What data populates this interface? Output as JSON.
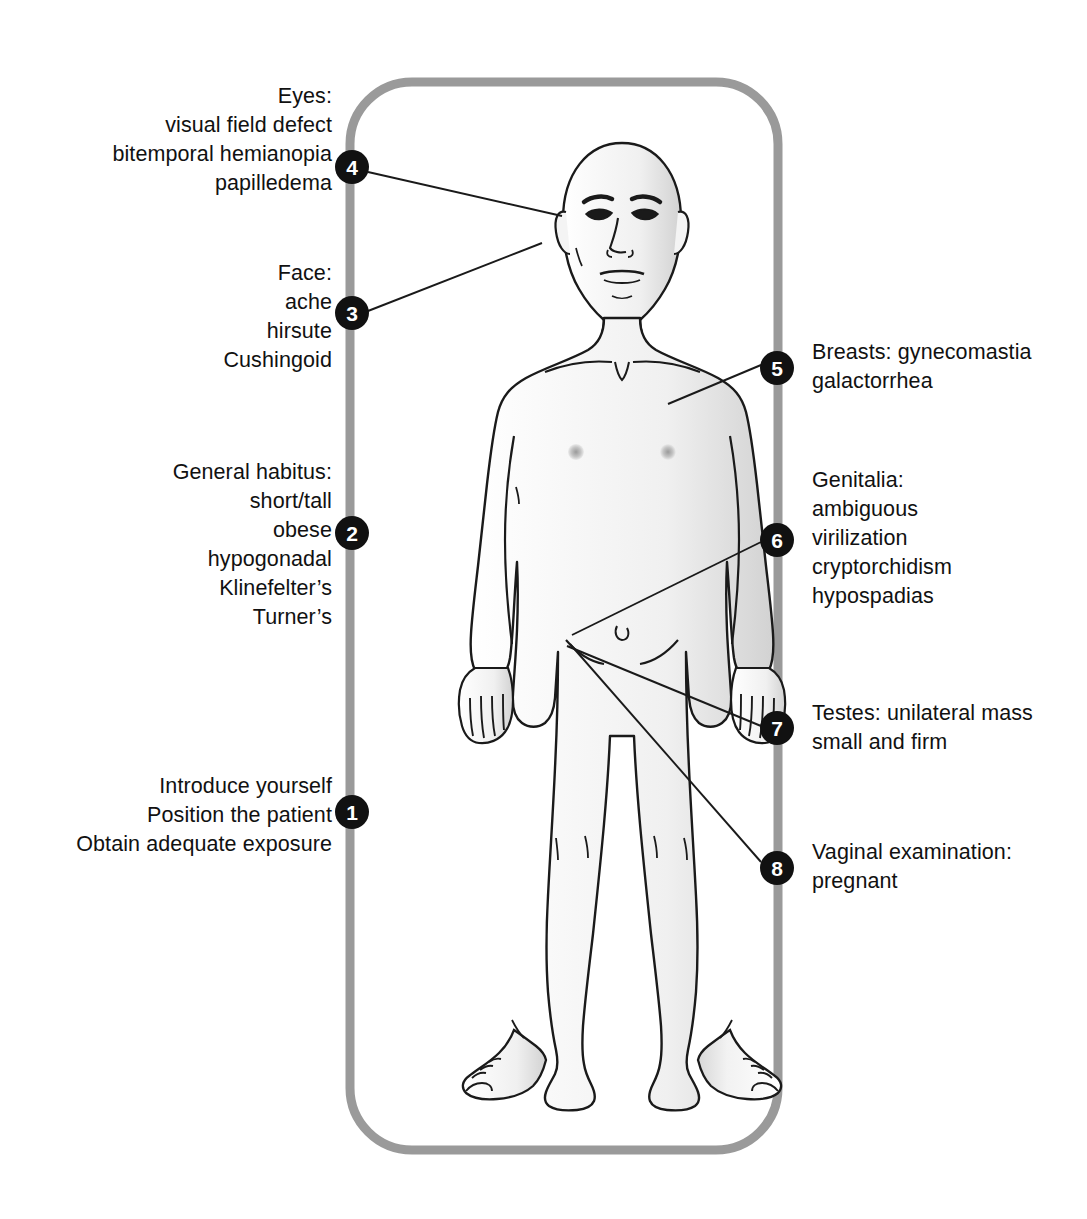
{
  "figure": {
    "border_color": "#9a9a9a",
    "marker_fill": "#111111",
    "marker_text_color": "#ffffff",
    "body_outline_color": "#1a1a1a",
    "body_shade_color": "#e9e9e9",
    "leader_line_color": "#1a1a1a"
  },
  "markers": [
    {
      "number": "1",
      "cx": 352,
      "cy": 812
    },
    {
      "number": "2",
      "cx": 352,
      "cy": 533
    },
    {
      "number": "3",
      "cx": 352,
      "cy": 313
    },
    {
      "number": "4",
      "cx": 352,
      "cy": 167
    },
    {
      "number": "5",
      "cx": 777,
      "cy": 368
    },
    {
      "number": "6",
      "cx": 777,
      "cy": 540
    },
    {
      "number": "7",
      "cx": 777,
      "cy": 728
    },
    {
      "number": "8",
      "cx": 777,
      "cy": 868
    }
  ],
  "labels": {
    "step1": {
      "number": "1",
      "text": "Introduce yourself\nPosition the patient\nObtain adequate exposure"
    },
    "step2": {
      "number": "2",
      "text": "General habitus:\nshort/tall\nobese\nhypogonadal\nKlinefelter’s\nTurner’s"
    },
    "step3": {
      "number": "3",
      "text": "Face:\nache\nhirsute\nCushingoid"
    },
    "step4": {
      "number": "4",
      "text": "Eyes:\nvisual field defect\nbitemporal hemianopia\npapilledema"
    },
    "step5": {
      "number": "5",
      "text": "Breasts: gynecomastia\ngalactorrhea"
    },
    "step6": {
      "number": "6",
      "text": "Genitalia:\nambiguous\nvirilization\ncryptorchidism\nhypospadias"
    },
    "step7": {
      "number": "7",
      "text": "Testes: unilateral mass\nsmall and firm"
    },
    "step8": {
      "number": "8",
      "text": "Vaginal examination:\npregnant"
    }
  }
}
